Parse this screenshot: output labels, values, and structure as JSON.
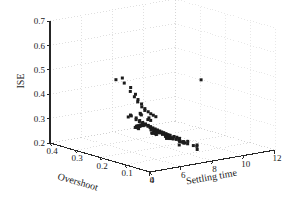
{
  "chart_data": {
    "type": "scatter",
    "projection": "3d",
    "title": "",
    "xlabel": "Overshoot",
    "ylabel": "Settling time",
    "zlabel": "ISE",
    "xlim": [
      0.4,
      0.0
    ],
    "ylim": [
      4,
      12
    ],
    "zlim": [
      0.2,
      0.7
    ],
    "xticks": [
      0.4,
      0.3,
      0.2,
      0.1,
      0
    ],
    "xtick_labels": [
      "0.4",
      "0.3",
      "0.2",
      "0.1",
      "0"
    ],
    "yticks": [
      4,
      6,
      8,
      10,
      12
    ],
    "ytick_labels": [
      "4",
      "6",
      "8",
      "10",
      "12"
    ],
    "zticks": [
      0.2,
      0.3,
      0.4,
      0.5,
      0.6,
      0.7
    ],
    "ztick_labels": [
      "0.2",
      "0.3",
      "0.4",
      "0.5",
      "0.6",
      "0.7"
    ],
    "grid": true,
    "grid_style": "dotted",
    "legend": null,
    "marker": "square",
    "marker_color": "#1c1c1c",
    "marker_size": 3,
    "grid_color": "#c9c9c9",
    "axis_color": "#262626",
    "n_points": 118,
    "points": [
      {
        "overshoot": 0.205,
        "settling": 5.1,
        "ise": 0.505
      },
      {
        "overshoot": 0.195,
        "settling": 5.35,
        "ise": 0.512
      },
      {
        "overshoot": 0.178,
        "settling": 5.2,
        "ise": 0.498
      },
      {
        "overshoot": 0.168,
        "settling": 5.45,
        "ise": 0.48
      },
      {
        "overshoot": 0.16,
        "settling": 5.3,
        "ise": 0.468
      },
      {
        "overshoot": 0.155,
        "settling": 5.55,
        "ise": 0.455
      },
      {
        "overshoot": 0.15,
        "settling": 5.4,
        "ise": 0.448
      },
      {
        "overshoot": 0.148,
        "settling": 5.6,
        "ise": 0.435
      },
      {
        "overshoot": 0.143,
        "settling": 5.5,
        "ise": 0.428
      },
      {
        "overshoot": 0.14,
        "settling": 5.7,
        "ise": 0.418
      },
      {
        "overshoot": 0.136,
        "settling": 5.65,
        "ise": 0.408
      },
      {
        "overshoot": 0.133,
        "settling": 5.8,
        "ise": 0.4
      },
      {
        "overshoot": 0.13,
        "settling": 5.75,
        "ise": 0.394
      },
      {
        "overshoot": 0.126,
        "settling": 5.9,
        "ise": 0.388
      },
      {
        "overshoot": 0.122,
        "settling": 6.0,
        "ise": 0.38
      },
      {
        "overshoot": 0.118,
        "settling": 6.1,
        "ise": 0.374
      },
      {
        "overshoot": 0.114,
        "settling": 6.2,
        "ise": 0.368
      },
      {
        "overshoot": 0.158,
        "settling": 5.9,
        "ise": 0.372
      },
      {
        "overshoot": 0.166,
        "settling": 6.05,
        "ise": 0.365
      },
      {
        "overshoot": 0.172,
        "settling": 6.2,
        "ise": 0.358
      },
      {
        "overshoot": 0.148,
        "settling": 6.3,
        "ise": 0.352
      },
      {
        "overshoot": 0.143,
        "settling": 6.15,
        "ise": 0.348
      },
      {
        "overshoot": 0.138,
        "settling": 6.25,
        "ise": 0.345
      },
      {
        "overshoot": 0.2,
        "settling": 5.95,
        "ise": 0.352
      },
      {
        "overshoot": 0.206,
        "settling": 6.1,
        "ise": 0.345
      },
      {
        "overshoot": 0.212,
        "settling": 6.0,
        "ise": 0.34
      },
      {
        "overshoot": 0.196,
        "settling": 6.25,
        "ise": 0.338
      },
      {
        "overshoot": 0.19,
        "settling": 6.15,
        "ise": 0.334
      },
      {
        "overshoot": 0.185,
        "settling": 6.3,
        "ise": 0.33
      },
      {
        "overshoot": 0.18,
        "settling": 6.2,
        "ise": 0.328
      },
      {
        "overshoot": 0.176,
        "settling": 6.35,
        "ise": 0.324
      },
      {
        "overshoot": 0.172,
        "settling": 6.28,
        "ise": 0.322
      },
      {
        "overshoot": 0.168,
        "settling": 6.4,
        "ise": 0.32
      },
      {
        "overshoot": 0.164,
        "settling": 6.33,
        "ise": 0.318
      },
      {
        "overshoot": 0.16,
        "settling": 6.45,
        "ise": 0.316
      },
      {
        "overshoot": 0.157,
        "settling": 6.38,
        "ise": 0.314
      },
      {
        "overshoot": 0.154,
        "settling": 6.5,
        "ise": 0.312
      },
      {
        "overshoot": 0.151,
        "settling": 6.42,
        "ise": 0.31
      },
      {
        "overshoot": 0.148,
        "settling": 6.55,
        "ise": 0.308
      },
      {
        "overshoot": 0.145,
        "settling": 6.48,
        "ise": 0.306
      },
      {
        "overshoot": 0.142,
        "settling": 6.6,
        "ise": 0.305
      },
      {
        "overshoot": 0.139,
        "settling": 6.52,
        "ise": 0.303
      },
      {
        "overshoot": 0.136,
        "settling": 6.65,
        "ise": 0.302
      },
      {
        "overshoot": 0.133,
        "settling": 6.58,
        "ise": 0.3
      },
      {
        "overshoot": 0.13,
        "settling": 6.7,
        "ise": 0.299
      },
      {
        "overshoot": 0.128,
        "settling": 6.62,
        "ise": 0.298
      },
      {
        "overshoot": 0.125,
        "settling": 6.75,
        "ise": 0.296
      },
      {
        "overshoot": 0.122,
        "settling": 6.68,
        "ise": 0.295
      },
      {
        "overshoot": 0.12,
        "settling": 6.8,
        "ise": 0.294
      },
      {
        "overshoot": 0.117,
        "settling": 6.72,
        "ise": 0.292
      },
      {
        "overshoot": 0.114,
        "settling": 6.85,
        "ise": 0.291
      },
      {
        "overshoot": 0.112,
        "settling": 6.78,
        "ise": 0.29
      },
      {
        "overshoot": 0.109,
        "settling": 6.9,
        "ise": 0.288
      },
      {
        "overshoot": 0.106,
        "settling": 6.82,
        "ise": 0.287
      },
      {
        "overshoot": 0.104,
        "settling": 6.95,
        "ise": 0.286
      },
      {
        "overshoot": 0.101,
        "settling": 6.88,
        "ise": 0.285
      },
      {
        "overshoot": 0.186,
        "settling": 6.55,
        "ise": 0.306
      },
      {
        "overshoot": 0.192,
        "settling": 6.48,
        "ise": 0.308
      },
      {
        "overshoot": 0.198,
        "settling": 6.62,
        "ise": 0.303
      },
      {
        "overshoot": 0.203,
        "settling": 6.7,
        "ise": 0.3
      },
      {
        "overshoot": 0.208,
        "settling": 6.58,
        "ise": 0.298
      },
      {
        "overshoot": 0.214,
        "settling": 6.72,
        "ise": 0.295
      },
      {
        "overshoot": 0.22,
        "settling": 6.65,
        "ise": 0.292
      },
      {
        "overshoot": 0.226,
        "settling": 6.8,
        "ise": 0.29
      },
      {
        "overshoot": 0.176,
        "settling": 6.88,
        "ise": 0.288
      },
      {
        "overshoot": 0.17,
        "settling": 6.95,
        "ise": 0.286
      },
      {
        "overshoot": 0.165,
        "settling": 7.02,
        "ise": 0.284
      },
      {
        "overshoot": 0.16,
        "settling": 7.1,
        "ise": 0.282
      },
      {
        "overshoot": 0.155,
        "settling": 7.05,
        "ise": 0.28
      },
      {
        "overshoot": 0.15,
        "settling": 7.18,
        "ise": 0.278
      },
      {
        "overshoot": 0.145,
        "settling": 7.12,
        "ise": 0.276
      },
      {
        "overshoot": 0.14,
        "settling": 7.25,
        "ise": 0.274
      },
      {
        "overshoot": 0.135,
        "settling": 7.2,
        "ise": 0.272
      },
      {
        "overshoot": 0.13,
        "settling": 7.32,
        "ise": 0.27
      },
      {
        "overshoot": 0.126,
        "settling": 7.28,
        "ise": 0.268
      },
      {
        "overshoot": 0.122,
        "settling": 7.4,
        "ise": 0.266
      },
      {
        "overshoot": 0.118,
        "settling": 7.35,
        "ise": 0.265
      },
      {
        "overshoot": 0.23,
        "settling": 7.0,
        "ise": 0.285
      },
      {
        "overshoot": 0.236,
        "settling": 7.15,
        "ise": 0.282
      },
      {
        "overshoot": 0.242,
        "settling": 7.05,
        "ise": 0.278
      },
      {
        "overshoot": 0.248,
        "settling": 7.22,
        "ise": 0.275
      },
      {
        "overshoot": 0.254,
        "settling": 7.12,
        "ise": 0.272
      },
      {
        "overshoot": 0.26,
        "settling": 7.3,
        "ise": 0.268
      },
      {
        "overshoot": 0.095,
        "settling": 7.05,
        "ise": 0.283
      },
      {
        "overshoot": 0.09,
        "settling": 7.15,
        "ise": 0.28
      },
      {
        "overshoot": 0.085,
        "settling": 7.25,
        "ise": 0.276
      },
      {
        "overshoot": 0.11,
        "settling": 7.45,
        "ise": 0.262
      },
      {
        "overshoot": 0.105,
        "settling": 7.55,
        "ise": 0.258
      },
      {
        "overshoot": 0.1,
        "settling": 7.5,
        "ise": 0.256
      },
      {
        "overshoot": 0.096,
        "settling": 7.62,
        "ise": 0.253
      },
      {
        "overshoot": 0.092,
        "settling": 7.7,
        "ise": 0.25
      },
      {
        "overshoot": 0.158,
        "settling": 7.6,
        "ise": 0.255
      },
      {
        "overshoot": 0.152,
        "settling": 7.72,
        "ise": 0.252
      },
      {
        "overshoot": 0.146,
        "settling": 7.82,
        "ise": 0.249
      },
      {
        "overshoot": 0.2,
        "settling": 7.55,
        "ise": 0.258
      },
      {
        "overshoot": 0.206,
        "settling": 7.68,
        "ise": 0.253
      },
      {
        "overshoot": 0.212,
        "settling": 7.8,
        "ise": 0.248
      },
      {
        "overshoot": 0.265,
        "settling": 7.48,
        "ise": 0.262
      },
      {
        "overshoot": 0.272,
        "settling": 7.62,
        "ise": 0.256
      },
      {
        "overshoot": 0.13,
        "settling": 8.0,
        "ise": 0.243
      },
      {
        "overshoot": 0.124,
        "settling": 8.12,
        "ise": 0.24
      },
      {
        "overshoot": 0.118,
        "settling": 8.05,
        "ise": 0.238
      },
      {
        "overshoot": 0.112,
        "settling": 8.2,
        "ise": 0.235
      },
      {
        "overshoot": 0.175,
        "settling": 8.05,
        "ise": 0.24
      },
      {
        "overshoot": 0.182,
        "settling": 8.18,
        "ise": 0.236
      },
      {
        "overshoot": 0.24,
        "settling": 7.95,
        "ise": 0.244
      },
      {
        "overshoot": 0.246,
        "settling": 8.1,
        "ise": 0.239
      },
      {
        "overshoot": 0.086,
        "settling": 8.15,
        "ise": 0.236
      },
      {
        "overshoot": 0.08,
        "settling": 8.28,
        "ise": 0.233
      },
      {
        "overshoot": 0.145,
        "settling": 8.45,
        "ise": 0.23
      },
      {
        "overshoot": 0.152,
        "settling": 8.6,
        "ise": 0.227
      },
      {
        "overshoot": 0.196,
        "settling": 8.52,
        "ise": 0.228
      },
      {
        "overshoot": 0.232,
        "settling": 8.7,
        "ise": 0.224
      },
      {
        "overshoot": 0.115,
        "settling": 8.85,
        "ise": 0.222
      },
      {
        "overshoot": 0.168,
        "settling": 9.1,
        "ise": 0.218
      },
      {
        "overshoot": 0.062,
        "settling": 6.05,
        "ise": 0.296
      },
      {
        "overshoot": 0.058,
        "settling": 6.8,
        "ise": 0.262
      },
      {
        "overshoot": 0.055,
        "settling": 7.9,
        "ise": 0.232
      },
      {
        "overshoot": 0.205,
        "settling": 10.55,
        "ise": 0.443
      }
    ]
  },
  "axes": {
    "z_title": "ISE",
    "x_title": "Overshoot",
    "y_title": "Settling time",
    "z_ticks": [
      "0.7",
      "0.6",
      "0.5",
      "0.4",
      "0.3",
      "0.2"
    ],
    "x_ticks": [
      "0.4",
      "0.3",
      "0.2",
      "0.1",
      "0"
    ],
    "y_ticks": [
      "4",
      "6",
      "8",
      "10",
      "12"
    ]
  }
}
